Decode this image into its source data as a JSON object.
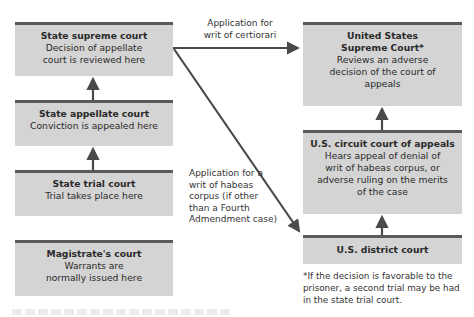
{
  "colors": {
    "box_fill": "#d4d4d4",
    "box_top_bar": "#5a5a5a",
    "arrow": "#4a4a4a",
    "text": "#2a2a2a"
  },
  "state_courts": [
    {
      "title": "State supreme court",
      "desc": "Decision of appellate court is reviewed here"
    },
    {
      "title": "State appellate court",
      "desc": "Conviction is appealed here"
    },
    {
      "title": "State trial court",
      "desc": "Trial takes place here"
    },
    {
      "title": "Magistrate's court",
      "desc": "Warrants are normally issued here"
    }
  ],
  "federal_courts": [
    {
      "title": "United States Supreme Court*",
      "desc": "Reviews an adverse decision of the court of appeals"
    },
    {
      "title": "U.S. circuit court of appeals",
      "desc": "Hears appeal of denial of writ of habeas corpus, or adverse ruling on the merits of the case"
    },
    {
      "title": "U.S. district court",
      "desc": ""
    }
  ],
  "edge_labels": {
    "certiorari": "Application for writ of certiorari",
    "habeas": "Application for a writ of habeas corpus (if other than a Fourth Admendment case)"
  },
  "footnote": "*If the decision is favorable to the prisoner, a second trial may be had in the state trial court."
}
